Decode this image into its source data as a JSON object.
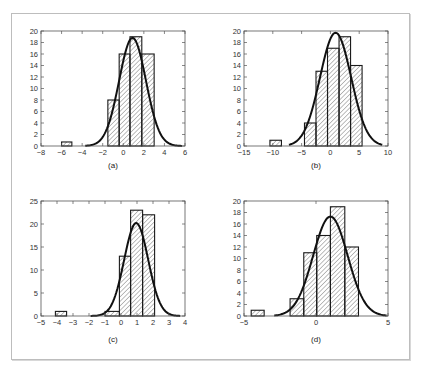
{
  "figure": {
    "panels_layout": "2x2 grid",
    "background": "#ffffff",
    "frame_color": "#bdbdbd"
  },
  "chart_data": [
    {
      "type": "bar",
      "subtype": "histogram_with_normal_fit",
      "caption": "(a)",
      "xlim": [
        -8,
        6
      ],
      "ylim": [
        0,
        20
      ],
      "xticks": [
        -8,
        -6,
        -4,
        -2,
        0,
        2,
        4,
        6
      ],
      "xtick_labels": [
        "−8",
        "−6",
        "−4",
        "−2",
        "0",
        "2",
        "4",
        "6"
      ],
      "yticks": [
        0,
        2,
        4,
        6,
        8,
        10,
        12,
        14,
        16,
        18,
        20
      ],
      "ytick_labels": [
        "0",
        "2",
        "4",
        "6",
        "8",
        "10",
        "12",
        "14",
        "16",
        "18",
        "20"
      ],
      "bins": [
        {
          "x0": -6.0,
          "x1": -5.0,
          "count": 0.7
        },
        {
          "x0": -1.5,
          "x1": -0.4,
          "count": 8
        },
        {
          "x0": -0.4,
          "x1": 0.65,
          "count": 16
        },
        {
          "x0": 0.65,
          "x1": 1.8,
          "count": 19
        },
        {
          "x0": 1.8,
          "x1": 3.0,
          "count": 16
        }
      ],
      "fit": {
        "mean": 0.9,
        "sd": 1.3,
        "peak": 18.8,
        "x_from": -3.7,
        "x_to": 5.7
      },
      "grid": false,
      "hatch": "diagonal"
    },
    {
      "type": "bar",
      "subtype": "histogram_with_normal_fit",
      "caption": "(b)",
      "xlim": [
        -15,
        10
      ],
      "ylim": [
        0,
        20
      ],
      "xticks": [
        -15,
        -10,
        -5,
        0,
        5,
        10
      ],
      "xtick_labels": [
        "−15",
        "−10",
        "−5",
        "0",
        "5",
        "10"
      ],
      "yticks": [
        0,
        2,
        4,
        6,
        8,
        10,
        12,
        14,
        16,
        18,
        20
      ],
      "ytick_labels": [
        "0",
        "2",
        "4",
        "6",
        "8",
        "10",
        "12",
        "14",
        "16",
        "18",
        "20"
      ],
      "bins": [
        {
          "x0": -10.5,
          "x1": -8.5,
          "count": 1
        },
        {
          "x0": -4.5,
          "x1": -2.5,
          "count": 4
        },
        {
          "x0": -2.5,
          "x1": -0.5,
          "count": 13
        },
        {
          "x0": -0.5,
          "x1": 1.5,
          "count": 17
        },
        {
          "x0": 1.5,
          "x1": 3.5,
          "count": 19
        },
        {
          "x0": 3.5,
          "x1": 5.5,
          "count": 14
        }
      ],
      "fit": {
        "mean": 0.9,
        "sd": 2.7,
        "peak": 19.7,
        "x_from": -7.2,
        "x_to": 9.0
      },
      "grid": false,
      "hatch": "diagonal"
    },
    {
      "type": "bar",
      "subtype": "histogram_with_normal_fit",
      "caption": "(c)",
      "xlim": [
        -5,
        4
      ],
      "ylim": [
        0,
        25
      ],
      "xticks": [
        -5,
        -4,
        -3,
        -2,
        -1,
        0,
        1,
        2,
        3,
        4
      ],
      "xtick_labels": [
        "−5",
        "−4",
        "−3",
        "−2",
        "−1",
        "0",
        "1",
        "2",
        "3",
        "4"
      ],
      "yticks": [
        0,
        5,
        10,
        15,
        20,
        25
      ],
      "ytick_labels": [
        "0",
        "5",
        "10",
        "15",
        "20",
        "25"
      ],
      "bins": [
        {
          "x0": -4.1,
          "x1": -3.4,
          "count": 1
        },
        {
          "x0": -1.0,
          "x1": -0.1,
          "count": 1
        },
        {
          "x0": -0.1,
          "x1": 0.6,
          "count": 13
        },
        {
          "x0": 0.6,
          "x1": 1.35,
          "count": 23
        },
        {
          "x0": 1.35,
          "x1": 2.1,
          "count": 22
        }
      ],
      "fit": {
        "mean": 0.95,
        "sd": 0.75,
        "peak": 20.2,
        "x_from": -1.9,
        "x_to": 3.7
      },
      "grid": false,
      "hatch": "diagonal"
    },
    {
      "type": "bar",
      "subtype": "histogram_with_normal_fit",
      "caption": "(d)",
      "xlim": [
        -5,
        5
      ],
      "ylim": [
        0,
        20
      ],
      "xticks": [
        -5,
        0,
        5
      ],
      "xtick_labels": [
        "−5",
        "0",
        "5"
      ],
      "yticks": [
        0,
        2,
        4,
        6,
        8,
        10,
        12,
        14,
        16,
        18,
        20
      ],
      "ytick_labels": [
        "0",
        "2",
        "4",
        "6",
        "8",
        "10",
        "12",
        "14",
        "16",
        "18",
        "20"
      ],
      "bins": [
        {
          "x0": -4.5,
          "x1": -3.6,
          "count": 1
        },
        {
          "x0": -1.8,
          "x1": -0.85,
          "count": 3
        },
        {
          "x0": -0.85,
          "x1": 0.05,
          "count": 11
        },
        {
          "x0": 0.05,
          "x1": 1.0,
          "count": 14
        },
        {
          "x0": 1.0,
          "x1": 2.0,
          "count": 19
        },
        {
          "x0": 2.0,
          "x1": 2.95,
          "count": 12
        }
      ],
      "fit": {
        "mean": 1.0,
        "sd": 1.2,
        "peak": 17.3,
        "x_from": -2.9,
        "x_to": 4.9
      },
      "grid": false,
      "hatch": "diagonal"
    }
  ],
  "layout_px": [
    {
      "left": 41,
      "right": 185,
      "top": 31,
      "bottom": 146,
      "caption_y": 168
    },
    {
      "left": 244,
      "right": 388,
      "top": 31,
      "bottom": 146,
      "caption_y": 168
    },
    {
      "left": 41,
      "right": 185,
      "top": 201,
      "bottom": 316,
      "caption_y": 342
    },
    {
      "left": 244,
      "right": 388,
      "top": 201,
      "bottom": 316,
      "caption_y": 342
    }
  ]
}
